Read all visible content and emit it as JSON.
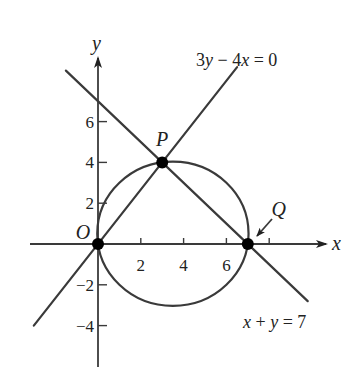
{
  "diagram": {
    "type": "coordinate-geometry",
    "axes": {
      "x_label": "x",
      "y_label": "y",
      "x_range": [
        -3,
        9.3
      ],
      "y_range": [
        -6,
        9
      ],
      "x_ticks": [
        {
          "value": 2,
          "label": "2"
        },
        {
          "value": 4,
          "label": "4"
        },
        {
          "value": 6,
          "label": "6"
        },
        {
          "value": 8,
          "label": ""
        }
      ],
      "y_ticks": [
        {
          "value": 6,
          "label": "6"
        },
        {
          "value": 4,
          "label": "4"
        },
        {
          "value": 2,
          "label": "2"
        },
        {
          "value": -2,
          "label": "−2"
        },
        {
          "value": -4,
          "label": "−4"
        }
      ]
    },
    "lines": [
      {
        "name": "line-3y-4x",
        "equation": "3y − 4x = 0",
        "from": [
          -3,
          -4
        ],
        "to": [
          6.5,
          8.67
        ]
      },
      {
        "name": "line-x-plus-y",
        "equation": "x + y = 7",
        "from": [
          -1.5,
          8.5
        ],
        "to": [
          9.8,
          -2.8
        ]
      }
    ],
    "circle": {
      "center": [
        3.5,
        0.5
      ],
      "radius": 3.5355
    },
    "points": [
      {
        "label": "O",
        "coords": [
          0,
          0
        ]
      },
      {
        "label": "P",
        "coords": [
          3,
          4
        ]
      },
      {
        "label": "Q",
        "coords": [
          7,
          0
        ]
      }
    ],
    "colors": {
      "ink": "#3a3a3a",
      "point": "#000000",
      "background": "#ffffff"
    }
  }
}
